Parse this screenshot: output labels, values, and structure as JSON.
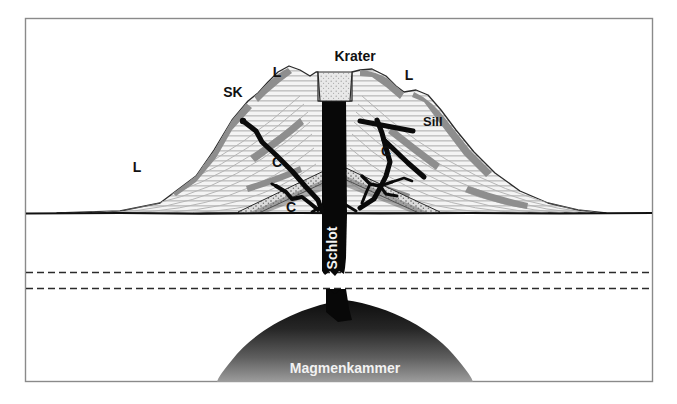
{
  "figure": {
    "kind": "geological-cross-section",
    "language": "de",
    "canvas": {
      "width": 677,
      "height": 404
    },
    "frame": {
      "x": 25,
      "y": 18,
      "width": 628,
      "height": 364,
      "stroke": "#8a8a8a",
      "fill": "#ffffff"
    }
  },
  "palette": {
    "background": "#ffffff",
    "frame_stroke": "#8a8a8a",
    "outline": "#1a1a1a",
    "conduit_black": "#080808",
    "lava_gray": "#8e8e8e",
    "bedding_light": "#ededed",
    "bedding_stroke": "#b9b9b9",
    "crater_fill": "#e6e6e6",
    "sill_stipple": "#cfcfcf",
    "magma_dark": "#1b1b1b",
    "magma_light": "#9a9a9a",
    "label_text": "#111111",
    "label_text_inverse": "#f2f2f2",
    "dashed_line": "#2b2b2b",
    "ground_line": "#111111"
  },
  "labels": [
    {
      "id": "krater",
      "text": "Krater",
      "meaning": "crater",
      "x": 355,
      "y": 61,
      "size": 14,
      "anchor": "middle",
      "rotate": 0,
      "color": "dark"
    },
    {
      "id": "lava-left-top",
      "text": "L",
      "meaning": "Lava",
      "x": 277,
      "y": 77,
      "size": 14,
      "anchor": "middle",
      "rotate": 0,
      "color": "dark"
    },
    {
      "id": "lava-right-top",
      "text": "L",
      "meaning": "Lava",
      "x": 409,
      "y": 80,
      "size": 14,
      "anchor": "middle",
      "rotate": 0,
      "color": "dark"
    },
    {
      "id": "lava-left-low",
      "text": "L",
      "meaning": "Lava",
      "x": 137,
      "y": 172,
      "size": 14,
      "anchor": "middle",
      "rotate": 0,
      "color": "dark"
    },
    {
      "id": "sk",
      "text": "SK",
      "meaning": "Schlackenkegel / Nebenkrater",
      "x": 233,
      "y": 97,
      "size": 14,
      "anchor": "middle",
      "rotate": 0,
      "color": "dark"
    },
    {
      "id": "sill",
      "text": "Sill",
      "meaning": "Sill (lagerförmige Intrusion)",
      "x": 423,
      "y": 126,
      "size": 13,
      "anchor": "start",
      "rotate": 0,
      "color": "dark"
    },
    {
      "id": "gang-left",
      "text": "C",
      "meaning": "Gang / Conduit",
      "x": 277,
      "y": 167,
      "size": 14,
      "anchor": "middle",
      "rotate": 0,
      "color": "dark"
    },
    {
      "id": "gang-right",
      "text": "C",
      "meaning": "Gang / Conduit",
      "x": 386,
      "y": 156,
      "size": 14,
      "anchor": "middle",
      "rotate": 0,
      "color": "dark"
    },
    {
      "id": "gang-bottom",
      "text": "C",
      "meaning": "Gang / Conduit",
      "x": 291,
      "y": 212,
      "size": 14,
      "anchor": "middle",
      "rotate": 0,
      "color": "dark"
    },
    {
      "id": "schlot",
      "text": "Schlot",
      "meaning": "vent / conduit",
      "x": 337,
      "y": 248,
      "size": 14,
      "anchor": "middle",
      "rotate": -90,
      "color": "inverse"
    },
    {
      "id": "magmenkammer",
      "text": "Magmenkammer",
      "meaning": "magma chamber",
      "x": 345,
      "y": 373,
      "size": 14,
      "anchor": "middle",
      "rotate": 0,
      "color": "inverse"
    }
  ],
  "legend_key": [
    {
      "code": "L",
      "expansion": "Lava"
    },
    {
      "code": "SK",
      "expansion": "Schlackenkegel"
    },
    {
      "code": "C",
      "expansion": "Gang (Conduit)"
    }
  ],
  "structure": {
    "ground_surface_y": 213,
    "dashed_lines_y": [
      272,
      288
    ],
    "crater_rim_y": 72,
    "summit_y": 66,
    "conduit_center_x": 334,
    "conduit_width": 22,
    "magma_chamber": {
      "center_x": 345,
      "top_y": 318,
      "base_y": 382,
      "half_width": 120
    }
  }
}
